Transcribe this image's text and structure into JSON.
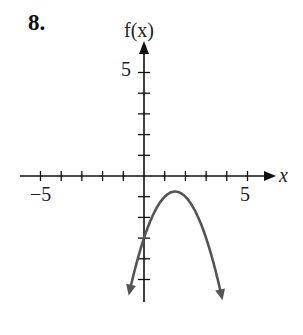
{
  "problem": {
    "number": "8."
  },
  "chart_data": {
    "type": "line",
    "title": "",
    "xlabel": "x",
    "ylabel": "f(x)",
    "xlim": [
      -6,
      6
    ],
    "ylim": [
      -6,
      6
    ],
    "x_ticks": [
      -5,
      -4,
      -3,
      -2,
      -1,
      1,
      2,
      3,
      4,
      5
    ],
    "y_ticks": [
      -5,
      -4,
      -3,
      -2,
      -1,
      1,
      2,
      3,
      4,
      5
    ],
    "x_tick_labels": {
      "-5": "−5",
      "5": "5"
    },
    "y_tick_labels": {
      "5": "5"
    },
    "grid": false,
    "legend": null,
    "series": [
      {
        "name": "f(x)",
        "description": "Downward-opening parabola, vertex near (1.5, -0.75), y-intercept -3, arrows at both ends",
        "equation_estimate": "f(x) = -x^2 + 3x - 3",
        "x": [
          -0.7,
          -0.5,
          0,
          0.5,
          1,
          1.5,
          2,
          2.5,
          3,
          3.5,
          3.75
        ],
        "y": [
          -5.59,
          -4.75,
          -3,
          -1.75,
          -1,
          -0.75,
          -1,
          -1.75,
          -3,
          -4.75,
          -5.81
        ],
        "color": "#555555"
      }
    ],
    "labels": {
      "x_axis": "x",
      "y_axis": "f(x)",
      "x_min_label": "−5",
      "x_max_label": "5",
      "y_max_label": "5"
    }
  }
}
